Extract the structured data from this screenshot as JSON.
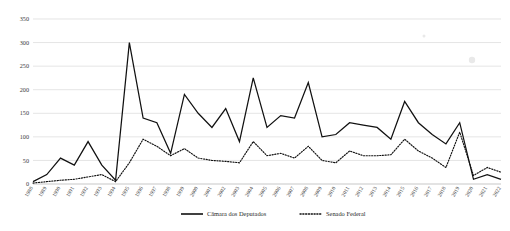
{
  "chart_data": {
    "type": "line",
    "title": "",
    "subtitle": "",
    "xlabel": "",
    "ylabel": "",
    "ylim": [
      0,
      350
    ],
    "ytick_values": [
      0,
      50,
      100,
      150,
      200,
      250,
      300,
      350
    ],
    "ytick_labels": [
      "0",
      "50",
      "100",
      "150",
      "200",
      "250",
      "300",
      "350"
    ],
    "grid": true,
    "grid_axis": "y",
    "legend_position": "bottom-center",
    "categories": [
      "1988",
      "1989",
      "1990",
      "1991",
      "1992",
      "1993",
      "1994",
      "1995",
      "1996",
      "1997",
      "1998",
      "1999",
      "2000",
      "2001",
      "2002",
      "2003",
      "2004",
      "2005",
      "2006",
      "2007",
      "2008",
      "2009",
      "2010",
      "2011",
      "2012",
      "2013",
      "2014",
      "2015",
      "2016",
      "2017",
      "2018",
      "2019",
      "2020",
      "2021",
      "2022"
    ],
    "series": [
      {
        "name": "Câmara dos Deputados",
        "style": "solid",
        "color": "#111111",
        "values": [
          5,
          20,
          55,
          40,
          90,
          40,
          8,
          300,
          140,
          130,
          65,
          190,
          150,
          120,
          160,
          90,
          225,
          120,
          145,
          140,
          215,
          100,
          105,
          130,
          125,
          120,
          95,
          175,
          130,
          105,
          85,
          130,
          10,
          20,
          10
        ]
      },
      {
        "name": "Senado Federal",
        "style": "dotted",
        "color": "#111111",
        "values": [
          2,
          5,
          8,
          10,
          15,
          20,
          5,
          45,
          95,
          80,
          60,
          75,
          55,
          50,
          48,
          45,
          90,
          60,
          65,
          55,
          80,
          50,
          45,
          70,
          60,
          60,
          62,
          95,
          70,
          55,
          35,
          110,
          18,
          35,
          25
        ]
      }
    ],
    "legend": [
      {
        "label": "Câmara dos Deputados",
        "style": "solid"
      },
      {
        "label": "Senado Federal",
        "style": "dotted"
      }
    ]
  }
}
